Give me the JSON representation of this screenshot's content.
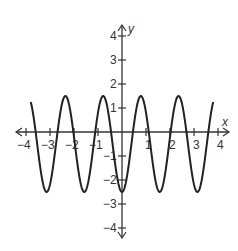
{
  "chart_data": {
    "type": "line",
    "title": "",
    "xlabel": "x",
    "ylabel": "y",
    "xlim": [
      -4,
      4
    ],
    "ylim": [
      -4,
      4
    ],
    "grid": false,
    "x_ticks": [
      -4,
      -3,
      -2,
      -1,
      1,
      2,
      3,
      4
    ],
    "y_ticks": [
      4,
      3,
      2,
      1,
      -1,
      -2,
      -3,
      -4
    ],
    "x_tick_labels": [
      "−4",
      "−3",
      "−2",
      "−1",
      "1",
      "2",
      "3",
      "4"
    ],
    "y_tick_labels": [
      "4",
      "3",
      "2",
      "1",
      "−1",
      "−2",
      "−3",
      "−4"
    ],
    "series": [
      {
        "name": "curve",
        "equation_approx": "y = -2cos(4x) - 0.5",
        "domain": [
          -3.8,
          3.8
        ],
        "maxima": [
          [
            -3.93,
            1.5
          ],
          [
            -2.36,
            1.5
          ],
          [
            -0.79,
            1.5
          ],
          [
            0.79,
            1.5
          ],
          [
            2.36,
            1.5
          ],
          [
            3.8,
            1.4
          ]
        ],
        "minima": [
          [
            -3.14,
            -2.5
          ],
          [
            -1.57,
            -2.5
          ],
          [
            0,
            -2.5
          ],
          [
            1.57,
            -2.5
          ],
          [
            3.14,
            -2.5
          ]
        ],
        "color": "#222222"
      }
    ]
  },
  "axes": {
    "x_label": "x",
    "y_label": "y"
  }
}
